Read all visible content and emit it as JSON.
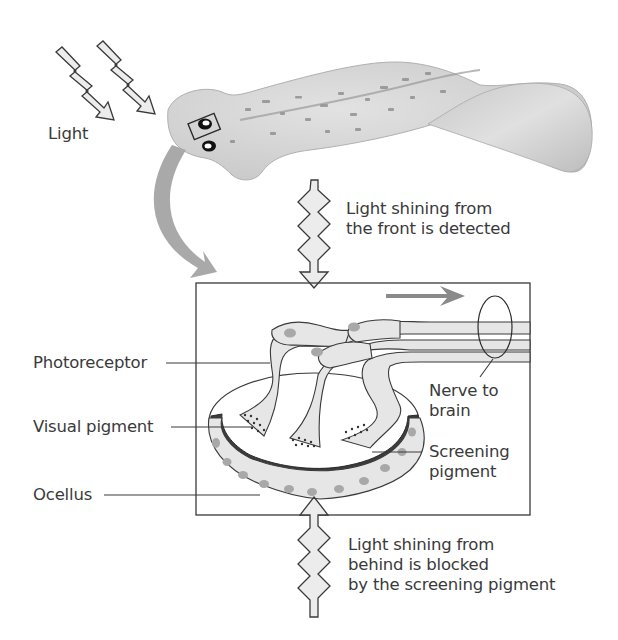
{
  "diagram": {
    "labels": {
      "light": "Light",
      "front_caption": [
        "Light shining from",
        "the front is detected"
      ],
      "behind_caption": [
        "Light shining from",
        "behind is blocked",
        "by the screening pigment"
      ],
      "photoreceptor": "Photoreceptor",
      "visual_pigment": "Visual pigment",
      "ocellus": "Ocellus",
      "nerve_to_brain": [
        "Nerve to",
        "brain"
      ],
      "screening_pigment": [
        "Screening",
        "pigment"
      ]
    },
    "colors": {
      "outline": "#3a3a3a",
      "body_fill": "#d4d4d4",
      "cell_fill": "#e6e6e6",
      "nucleus": "#a8a8a8",
      "screening_pigment": "#3c3c3c",
      "arrow_fill": "#e8e8e8",
      "curved_arrow": "#a9a9a9",
      "signal_arrow": "#8a8a8a"
    }
  }
}
